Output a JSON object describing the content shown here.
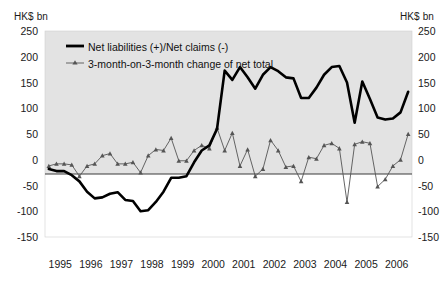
{
  "axis_unit_left": "HK$ bn",
  "axis_unit_right": "HK$ bn",
  "legend": {
    "series1": "Net liabilities (+)/Net claims (-)",
    "series2": "3-month-on-3-month change of net total"
  },
  "chart_data": {
    "type": "line",
    "title": "",
    "xlabel": "",
    "ylabel": "HK$ bn",
    "ylim": [
      -150,
      250
    ],
    "yticks": [
      250,
      200,
      150,
      100,
      50,
      0,
      -50,
      -100,
      -150
    ],
    "xticks": [
      "1995",
      "1996",
      "1997",
      "1998",
      "1999",
      "2000",
      "2001",
      "2002",
      "2003",
      "2004",
      "2005",
      "2006"
    ],
    "grid": false,
    "legend_position": "top-left-inside",
    "x_quarters": [
      "1995Q1",
      "1995Q2",
      "1995Q3",
      "1995Q4",
      "1996Q1",
      "1996Q2",
      "1996Q3",
      "1996Q4",
      "1997Q1",
      "1997Q2",
      "1997Q3",
      "1997Q4",
      "1998Q1",
      "1998Q2",
      "1998Q3",
      "1998Q4",
      "1999Q1",
      "1999Q2",
      "1999Q3",
      "1999Q4",
      "2000Q1",
      "2000Q2",
      "2000Q3",
      "2000Q4",
      "2001Q1",
      "2001Q2",
      "2001Q3",
      "2001Q4",
      "2002Q1",
      "2002Q2",
      "2002Q3",
      "2002Q4",
      "2003Q1",
      "2003Q2",
      "2003Q3",
      "2003Q4",
      "2004Q1",
      "2004Q2",
      "2004Q3",
      "2004Q4",
      "2005Q1",
      "2005Q2",
      "2005Q3",
      "2005Q4",
      "2006Q1",
      "2006Q2",
      "2006Q3",
      "2006Q4"
    ],
    "series": [
      {
        "name": "Net liabilities (+)/Net claims (-)",
        "style": "thick-solid-black",
        "color": "#000000",
        "markers": false,
        "values": [
          -18,
          -22,
          -22,
          -30,
          -42,
          -62,
          -75,
          -73,
          -66,
          -63,
          -78,
          -80,
          -100,
          -98,
          -82,
          -62,
          -35,
          -35,
          -32,
          -5,
          18,
          28,
          60,
          173,
          155,
          180,
          160,
          138,
          165,
          180,
          172,
          160,
          158,
          120,
          120,
          140,
          165,
          180,
          182,
          150,
          72,
          152,
          118,
          82,
          78,
          80,
          92,
          132
        ]
      },
      {
        "name": "3-month-on-3-month change of net total",
        "style": "thin-solid-gray-with-markers",
        "color": "#555555",
        "markers": true,
        "values": [
          -12,
          -8,
          -8,
          -10,
          -32,
          -12,
          -8,
          8,
          12,
          -8,
          -8,
          -5,
          -25,
          8,
          20,
          18,
          42,
          -2,
          -2,
          18,
          28,
          22,
          62,
          18,
          52,
          -12,
          20,
          -32,
          -18,
          38,
          18,
          -14,
          -12,
          -42,
          5,
          2,
          28,
          32,
          22,
          -82,
          30,
          35,
          32,
          -52,
          -38,
          -12,
          0,
          50
        ]
      }
    ]
  }
}
